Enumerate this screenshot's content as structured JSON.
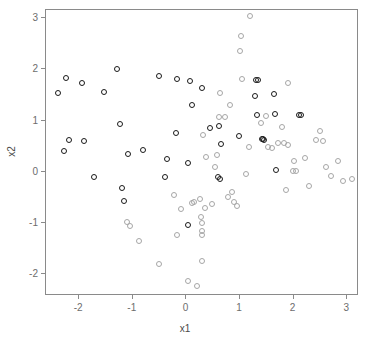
{
  "chart_data": {
    "type": "scatter",
    "title": "",
    "xlabel": "x1",
    "ylabel": "x2",
    "xlim": [
      -2.62,
      3.22
    ],
    "ylim": [
      -2.43,
      3.16
    ],
    "xticks": [
      -2,
      -1,
      0,
      1,
      2,
      3
    ],
    "xticklabels": [
      "-2",
      "-1",
      "0",
      "1",
      "2",
      "3"
    ],
    "yticks": [
      -2,
      -1,
      0,
      1,
      2,
      3
    ],
    "yticklabels": [
      "-2",
      "-1",
      "0",
      "1",
      "2",
      "3"
    ],
    "grid": false,
    "legend": null,
    "frame": true,
    "series": [
      {
        "name": "group-1",
        "marker": "open-circle",
        "color": "#1a1a1a",
        "points": [
          [
            -2.38,
            1.51
          ],
          [
            -2.23,
            1.82
          ],
          [
            -1.93,
            1.71
          ],
          [
            -1.52,
            1.53
          ],
          [
            -2.18,
            0.6
          ],
          [
            -2.27,
            0.38
          ],
          [
            -1.9,
            0.58
          ],
          [
            -1.71,
            -0.12
          ],
          [
            -1.28,
            1.98
          ],
          [
            -1.22,
            0.92
          ],
          [
            -1.19,
            -0.34
          ],
          [
            -1.14,
            -0.59
          ],
          [
            -1.08,
            0.33
          ],
          [
            -0.79,
            0.41
          ],
          [
            -0.5,
            1.86
          ],
          [
            -0.35,
            0.23
          ],
          [
            -0.39,
            -0.12
          ],
          [
            -0.16,
            1.79
          ],
          [
            -0.17,
            0.73
          ],
          [
            0.05,
            0.15
          ],
          [
            0.08,
            1.76
          ],
          [
            0.12,
            1.29
          ],
          [
            0.04,
            -1.06
          ],
          [
            0.3,
            1.62
          ],
          [
            0.46,
            0.84
          ],
          [
            0.63,
            0.87
          ],
          [
            0.66,
            0.53
          ],
          [
            0.61,
            -0.13
          ],
          [
            0.64,
            -0.16
          ],
          [
            1.0,
            0.67
          ],
          [
            1.29,
            1.45
          ],
          [
            1.32,
            1.78
          ],
          [
            1.35,
            1.78
          ],
          [
            1.34,
            1.08
          ],
          [
            1.43,
            0.62
          ],
          [
            1.45,
            0.61
          ],
          [
            1.47,
            0.6
          ],
          [
            1.66,
            1.5
          ],
          [
            1.68,
            1.11
          ],
          [
            1.69,
            0.01
          ],
          [
            2.12,
            1.08
          ],
          [
            2.15,
            1.09
          ]
        ]
      },
      {
        "name": "group-2",
        "marker": "open-circle",
        "color": "#a6a6a6",
        "points": [
          [
            -1.09,
            -1.0
          ],
          [
            -1.04,
            -1.08
          ],
          [
            -0.86,
            -1.38
          ],
          [
            -0.5,
            -1.83
          ],
          [
            -0.22,
            -0.47
          ],
          [
            -0.15,
            -1.26
          ],
          [
            -0.09,
            -0.75
          ],
          [
            0.05,
            -2.15
          ],
          [
            0.12,
            -0.64
          ],
          [
            0.16,
            -0.62
          ],
          [
            0.22,
            -2.26
          ],
          [
            0.27,
            -0.56
          ],
          [
            0.29,
            -0.9
          ],
          [
            0.31,
            -1.03
          ],
          [
            0.31,
            -1.18
          ],
          [
            0.31,
            -1.25
          ],
          [
            0.31,
            -1.76
          ],
          [
            0.36,
            -0.72
          ],
          [
            0.38,
            0.26
          ],
          [
            0.33,
            0.69
          ],
          [
            0.5,
            -0.66
          ],
          [
            0.55,
            0.07
          ],
          [
            0.58,
            0.3
          ],
          [
            0.62,
            1.04
          ],
          [
            0.65,
            1.52
          ],
          [
            0.73,
            1.05
          ],
          [
            0.8,
            -0.52
          ],
          [
            0.83,
            1.29
          ],
          [
            0.86,
            -0.41
          ],
          [
            0.9,
            -0.62
          ],
          [
            0.97,
            -0.7
          ],
          [
            1.02,
            2.34
          ],
          [
            1.04,
            2.64
          ],
          [
            1.06,
            1.79
          ],
          [
            1.2,
            3.02
          ],
          [
            1.13,
            -0.07
          ],
          [
            1.18,
            0.46
          ],
          [
            1.41,
            0.93
          ],
          [
            1.5,
            1.06
          ],
          [
            1.55,
            0.47
          ],
          [
            1.62,
            0.44
          ],
          [
            1.72,
            0.54
          ],
          [
            1.8,
            0.86
          ],
          [
            1.84,
            0.55
          ],
          [
            1.88,
            -0.38
          ],
          [
            1.91,
            0.5
          ],
          [
            1.92,
            1.71
          ],
          [
            2.0,
            0.0
          ],
          [
            2.02,
            0.18
          ],
          [
            2.07,
            -0.01
          ],
          [
            2.23,
            0.24
          ],
          [
            2.31,
            -0.29
          ],
          [
            2.43,
            0.59
          ],
          [
            2.52,
            0.77
          ],
          [
            2.57,
            0.58
          ],
          [
            2.62,
            0.07
          ],
          [
            2.72,
            -0.11
          ],
          [
            2.85,
            0.18
          ],
          [
            2.94,
            -0.21
          ],
          [
            3.1,
            -0.16
          ]
        ]
      }
    ]
  },
  "axes": {
    "x_label": "x1",
    "y_label": "x2"
  }
}
